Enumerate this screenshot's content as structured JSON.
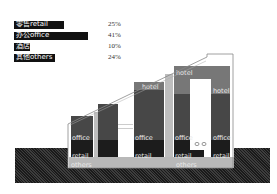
{
  "legend": [
    {
      "label": "零售retail",
      "pct": "25%",
      "bar_width": 50
    },
    {
      "label": "办公office",
      "pct": "41%",
      "bar_width": 74
    },
    {
      "label": "酒店hotel",
      "pct": "10%",
      "bar_width": 16
    },
    {
      "label": "其他others",
      "pct": "24%",
      "bar_width": 41
    }
  ],
  "section_labels": {
    "hotel": "hotel",
    "office": "office",
    "retail": "retail",
    "others": "others"
  },
  "colors": {
    "hotel": "#777777",
    "office": "#474747",
    "retail": "#1c1c1c",
    "others": "#b8b8b8",
    "core": "#bdbdbd",
    "ground": "#2a2a2a"
  }
}
